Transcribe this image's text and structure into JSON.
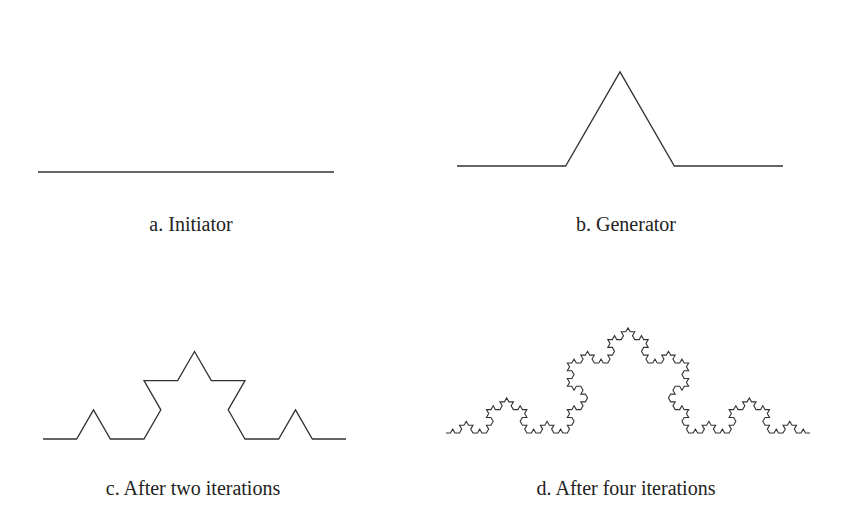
{
  "figure": {
    "stroke_color": "#333333",
    "background": "#ffffff",
    "panels": [
      {
        "id": "a",
        "caption": "a. Initiator",
        "iterations": 0,
        "start": [
          38,
          172
        ],
        "end": [
          334,
          172
        ],
        "caption_pos": [
          191,
          213
        ]
      },
      {
        "id": "b",
        "caption": "b.  Generator",
        "iterations": 1,
        "start": [
          457,
          166
        ],
        "end": [
          783,
          166
        ],
        "caption_pos": [
          626,
          213
        ]
      },
      {
        "id": "c",
        "caption": "c. After two iterations",
        "iterations": 2,
        "start": [
          43,
          439
        ],
        "end": [
          346,
          439
        ],
        "caption_pos": [
          193,
          477
        ]
      },
      {
        "id": "d",
        "caption": "d.  After four iterations",
        "iterations": 4,
        "start": [
          446,
          433
        ],
        "end": [
          810,
          433
        ],
        "caption_pos": [
          626,
          477
        ]
      }
    ]
  }
}
